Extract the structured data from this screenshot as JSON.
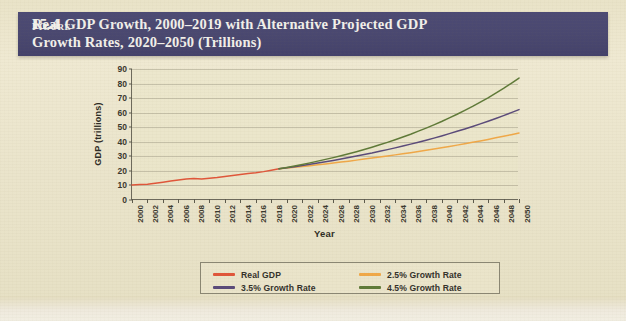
{
  "figure": {
    "label": "Figure",
    "number": "15.4",
    "title_line1": "Real GDP Growth, 2000–2019 with Alternative Projected GDP",
    "title_line2": "Growth Rates, 2020–2050 (Trillions)"
  },
  "colors": {
    "header_band": "#4a4870",
    "header_text": "#f2f0ea",
    "page_background": "#eae4cb",
    "plot_background": "#ece7cd",
    "axis": "#6d6a5c",
    "gridline": "#78746 2",
    "real_gdp": "#e0563a",
    "growth_25": "#f0a848",
    "growth_35": "#5a4a7a",
    "growth_45": "#5f7a38"
  },
  "legend": {
    "position": "bottom-center",
    "entries": [
      {
        "label": "Real GDP",
        "color": "#e0563a"
      },
      {
        "label": "2.5% Growth Rate",
        "color": "#f0a848"
      },
      {
        "label": "3.5% Growth Rate",
        "color": "#5a4a7a"
      },
      {
        "label": "4.5% Growth Rate",
        "color": "#5f7a38"
      }
    ]
  },
  "source_note": "",
  "chart_data": {
    "type": "line",
    "title": "Real GDP Growth, 2000–2019 with Alternative Projected GDP Growth Rates, 2020–2050 (Trillions)",
    "xlabel": "Year",
    "ylabel": "GDP (trillions)",
    "xlim": [
      2000,
      2050
    ],
    "ylim": [
      0,
      90
    ],
    "ytick_step": 10,
    "yticks": [
      0,
      10,
      20,
      30,
      40,
      50,
      60,
      70,
      80,
      90
    ],
    "xticks": [
      2000,
      2002,
      2004,
      2006,
      2008,
      2010,
      2012,
      2014,
      2016,
      2018,
      2020,
      2022,
      2024,
      2026,
      2028,
      2030,
      2032,
      2034,
      2036,
      2038,
      2040,
      2042,
      2044,
      2046,
      2048,
      2050
    ],
    "grid": true,
    "x": [
      2000,
      2001,
      2002,
      2003,
      2004,
      2005,
      2006,
      2007,
      2008,
      2009,
      2010,
      2011,
      2012,
      2013,
      2014,
      2015,
      2016,
      2017,
      2018,
      2019,
      2020,
      2021,
      2022,
      2023,
      2024,
      2025,
      2026,
      2027,
      2028,
      2029,
      2030,
      2031,
      2032,
      2033,
      2034,
      2035,
      2036,
      2037,
      2038,
      2039,
      2040,
      2041,
      2042,
      2043,
      2044,
      2045,
      2046,
      2047,
      2048,
      2049,
      2050
    ],
    "series": [
      {
        "name": "Real GDP",
        "color": "#e0563a",
        "values": [
          10.3,
          10.6,
          10.9,
          11.5,
          12.2,
          13.0,
          13.8,
          14.5,
          14.8,
          14.4,
          15.0,
          15.5,
          16.2,
          16.8,
          17.5,
          18.2,
          18.7,
          19.5,
          20.5,
          21.4,
          null,
          null,
          null,
          null,
          null,
          null,
          null,
          null,
          null,
          null,
          null,
          null,
          null,
          null,
          null,
          null,
          null,
          null,
          null,
          null,
          null,
          null,
          null,
          null,
          null,
          null,
          null,
          null,
          null,
          null,
          null
        ]
      },
      {
        "name": "2.5% Growth Rate",
        "color": "#f0a848",
        "values": [
          null,
          null,
          null,
          null,
          null,
          null,
          null,
          null,
          null,
          null,
          null,
          null,
          null,
          null,
          null,
          null,
          null,
          null,
          null,
          21.4,
          21.9,
          22.5,
          23.0,
          23.6,
          24.2,
          24.8,
          25.4,
          26.1,
          26.7,
          27.4,
          28.1,
          28.8,
          29.5,
          30.2,
          31.0,
          31.7,
          32.5,
          33.3,
          34.2,
          35.0,
          35.9,
          36.8,
          37.7,
          38.7,
          39.6,
          40.6,
          41.6,
          42.7,
          43.8,
          44.9,
          46.0
        ]
      },
      {
        "name": "3.5% Growth Rate",
        "color": "#5a4a7a",
        "values": [
          null,
          null,
          null,
          null,
          null,
          null,
          null,
          null,
          null,
          null,
          null,
          null,
          null,
          null,
          null,
          null,
          null,
          null,
          null,
          21.4,
          22.1,
          22.9,
          23.7,
          24.5,
          25.4,
          26.3,
          27.2,
          28.2,
          29.2,
          30.2,
          31.3,
          32.3,
          33.5,
          34.6,
          35.8,
          37.1,
          38.4,
          39.7,
          41.1,
          42.5,
          44.0,
          45.6,
          47.2,
          48.8,
          50.5,
          52.3,
          54.1,
          56.0,
          58.0,
          60.0,
          62.1
        ]
      },
      {
        "name": "4.5% Growth Rate",
        "color": "#5f7a38",
        "values": [
          null,
          null,
          null,
          null,
          null,
          null,
          null,
          null,
          null,
          null,
          null,
          null,
          null,
          null,
          null,
          null,
          null,
          null,
          null,
          21.4,
          22.4,
          23.4,
          24.4,
          25.5,
          26.7,
          27.9,
          29.1,
          30.4,
          31.8,
          33.2,
          34.7,
          36.3,
          37.9,
          39.6,
          41.4,
          43.3,
          45.2,
          47.3,
          49.4,
          51.6,
          53.9,
          56.4,
          58.9,
          61.6,
          64.3,
          67.2,
          70.2,
          73.4,
          76.7,
          80.2,
          83.8
        ]
      }
    ]
  }
}
